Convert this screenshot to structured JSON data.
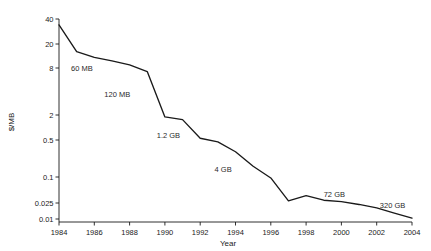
{
  "chart_data": {
    "type": "line",
    "title": "",
    "xlabel": "Year",
    "ylabel": "$/MB",
    "yscale": "log",
    "xlim": [
      1984,
      2004
    ],
    "ylim": [
      0.01,
      40
    ],
    "grid": false,
    "legend": false,
    "xticks": [
      "1984",
      "1986",
      "1988",
      "1990",
      "1992",
      "1994",
      "1996",
      "1998",
      "2000",
      "2002",
      "2004"
    ],
    "xtick_values": [
      1984,
      1986,
      1988,
      1990,
      1992,
      1994,
      1996,
      1998,
      2000,
      2002,
      2004
    ],
    "yticks": [
      "40",
      "20",
      "8",
      "2",
      "0.5",
      "0.1",
      "0.025",
      "0.01"
    ],
    "ytick_values": [
      40,
      20,
      8,
      2,
      0.5,
      0.1,
      0.025,
      0.01
    ],
    "x": [
      1984,
      1985,
      1986,
      1987,
      1988,
      1989,
      1990,
      1991,
      1992,
      1993,
      1994,
      1995,
      1996,
      1997,
      1998,
      1999,
      2000,
      2001,
      2002,
      2003,
      2004
    ],
    "values": [
      34,
      15,
      12,
      10.5,
      9,
      7.2,
      1.8,
      1.55,
      0.55,
      0.46,
      0.3,
      0.16,
      0.095,
      0.028,
      0.037,
      0.029,
      0.027,
      0.023,
      0.019,
      0.014,
      0.0105
    ],
    "series": [
      {
        "name": "Hard drive cost per megabyte",
        "values": [
          34,
          15,
          12,
          10.5,
          9,
          7.2,
          1.8,
          1.55,
          0.55,
          0.46,
          0.3,
          0.16,
          0.095,
          0.028,
          0.037,
          0.029,
          0.027,
          0.023,
          0.019,
          0.014,
          0.0105
        ]
      }
    ],
    "annotations": [
      {
        "label": "60 MB",
        "x": 1985.3,
        "y": 7.4
      },
      {
        "label": "120 MB",
        "x": 1987.3,
        "y": 3.4
      },
      {
        "label": "1.2 GB",
        "x": 1990.2,
        "y": 0.55
      },
      {
        "label": "4 GB",
        "x": 1993.3,
        "y": 0.125
      },
      {
        "label": "72 GB",
        "x": 1999.6,
        "y": 0.034
      },
      {
        "label": "320 GB",
        "x": 2002.9,
        "y": 0.0185
      }
    ]
  },
  "axes": {
    "x_title": "Year",
    "y_title": "$/MB"
  }
}
